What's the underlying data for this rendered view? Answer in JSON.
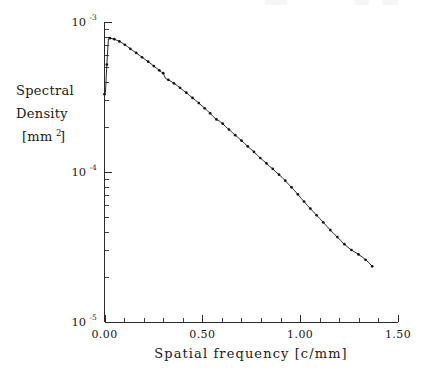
{
  "chart_data": {
    "type": "line",
    "title": "",
    "xlabel": "Spatial frequency [c/mm]",
    "ylabel_lines": [
      "Spectral",
      "Density",
      "[mm"
    ],
    "ylabel_sup": "2",
    "ylabel_tail": " ]",
    "yscale": "log",
    "xscale": "linear",
    "xlim": [
      0.0,
      1.5
    ],
    "ylim": [
      1e-05,
      0.001
    ],
    "grid": false,
    "legend": null,
    "xticks": [
      0.0,
      0.5,
      1.0,
      1.5
    ],
    "xtick_labels": [
      "0.00",
      "0.50",
      "1.00",
      "1.50"
    ],
    "x_minor_tick_step": 0.1,
    "yticks": [
      1e-05,
      0.0001,
      0.001
    ],
    "ytick_labels": [
      {
        "base": "10",
        "exp": "-5"
      },
      {
        "base": "10",
        "exp": "-4"
      },
      {
        "base": "10",
        "exp": "-3"
      }
    ],
    "marker": "filled-circle",
    "line_color": "#2a2a2a",
    "marker_color": "#141414",
    "axis_color": "#2b2b2b",
    "series": [
      {
        "name": "Spectral density",
        "x": [
          0.0,
          0.005,
          0.012,
          0.02,
          0.028,
          0.038,
          0.05,
          0.063,
          0.076,
          0.09,
          0.104,
          0.118,
          0.132,
          0.147,
          0.162,
          0.177,
          0.192,
          0.208,
          0.223,
          0.238,
          0.252,
          0.266,
          0.28,
          0.292,
          0.3,
          0.312,
          0.326,
          0.34,
          0.355,
          0.37,
          0.386,
          0.402,
          0.418,
          0.434,
          0.45,
          0.466,
          0.482,
          0.498,
          0.512,
          0.526,
          0.54,
          0.556,
          0.572,
          0.588,
          0.604,
          0.62,
          0.636,
          0.652,
          0.668,
          0.684,
          0.7,
          0.716,
          0.732,
          0.748,
          0.764,
          0.78,
          0.796,
          0.812,
          0.828,
          0.844,
          0.86,
          0.876,
          0.892,
          0.908,
          0.924,
          0.94,
          0.956,
          0.972,
          0.988,
          1.004,
          1.02,
          1.036,
          1.052,
          1.068,
          1.084,
          1.1,
          1.118,
          1.136,
          1.154,
          1.172,
          1.19,
          1.208,
          1.226,
          1.244,
          1.262,
          1.28,
          1.298,
          1.316,
          1.334,
          1.352,
          1.368
        ],
        "y": [
          0.00033,
          0.00034,
          0.00052,
          0.00077,
          0.00078,
          0.000775,
          0.000768,
          0.000755,
          0.000742,
          0.000725,
          0.000705,
          0.000685,
          0.000662,
          0.000642,
          0.000622,
          0.000602,
          0.000582,
          0.000562,
          0.000544,
          0.000526,
          0.000508,
          0.000492,
          0.000476,
          0.000462,
          0.000456,
          0.00042,
          0.000412,
          0.000402,
          0.00039,
          0.000378,
          0.000364,
          0.00035,
          0.000338,
          0.000324,
          0.000312,
          0.0003,
          0.000288,
          0.000276,
          0.000266,
          0.000256,
          0.000246,
          0.000234,
          0.000224,
          0.000218,
          0.00021,
          0.0002,
          0.000192,
          0.000184,
          0.000176,
          0.000169,
          0.000162,
          0.000155,
          0.000148,
          0.000142,
          0.000136,
          0.00013,
          0.000124,
          0.000119,
          0.000114,
          0.000109,
          0.000105,
          0.0001,
          9.6e-05,
          9.2e-05,
          8.75e-05,
          8.3e-05,
          7.9e-05,
          7.5e-05,
          7.1e-05,
          6.7e-05,
          6.35e-05,
          6e-05,
          5.7e-05,
          5.42e-05,
          5.15e-05,
          4.9e-05,
          4.62e-05,
          4.35e-05,
          4.1e-05,
          3.88e-05,
          3.68e-05,
          3.48e-05,
          3.3e-05,
          3.15e-05,
          3.02e-05,
          2.92e-05,
          2.82e-05,
          2.72e-05,
          2.6e-05,
          2.48e-05,
          2.35e-05
        ]
      }
    ]
  },
  "axes": {
    "x_title": "Spatial frequency [c/mm]",
    "y_title_line1": "Spectral",
    "y_title_line2": "Density",
    "y_title_line3_pre": "[mm",
    "y_title_line3_sup": "2",
    "y_title_line3_post": " ]"
  }
}
